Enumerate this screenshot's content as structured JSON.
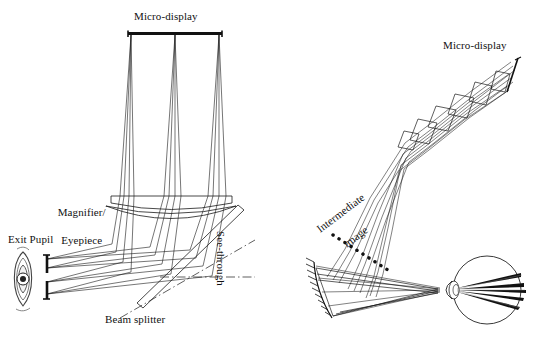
{
  "figure": {
    "width": 537,
    "height": 338,
    "background_color": "#ffffff",
    "ink_color": "#1a1a1a"
  },
  "left_diagram": {
    "name": "conventional magnifier eyepiece see-through HMD",
    "labels": {
      "microdisplay": "Micro-display",
      "magnifier_line1": "Magnifier/",
      "magnifier_line2": "Eyepiece",
      "exit_pupil": "Exit Pupil",
      "beam_splitter": "Beam splitter",
      "see_through": "See-through"
    },
    "components": [
      "micro-display panel",
      "magnifier lens element 1",
      "magnifier lens element 2",
      "tilted plate beam splitter",
      "exit pupil aperture stop",
      "eye"
    ],
    "ray_bundles": 3
  },
  "right_diagram": {
    "name": "freeform prism / relay head-mounted display",
    "labels": {
      "microdisplay": "Micro-display",
      "intermediate_line1": "Intermediate",
      "intermediate_line2": "image"
    },
    "components": [
      "micro-display panel",
      "tilted relay lens group",
      "intermediate image plane",
      "hatched freeform reflective surface",
      "eyeball"
    ],
    "ray_bundles": 3
  }
}
